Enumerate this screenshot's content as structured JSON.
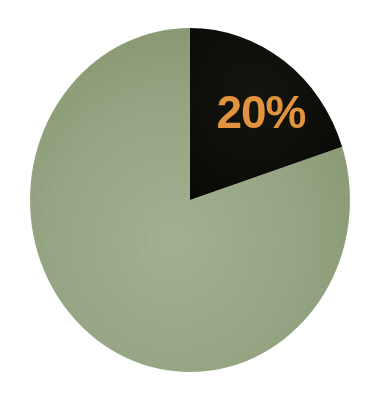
{
  "chart_data": {
    "type": "pie",
    "title": "",
    "subtitle": "",
    "xlabel": "",
    "ylabel": "",
    "grid": false,
    "legend_position": "none",
    "start_angle_deg": 0,
    "direction": "clockwise",
    "categories": [
      "Highlighted share",
      "Remainder"
    ],
    "values": [
      20,
      80
    ],
    "labels": [
      "20%",
      ""
    ],
    "colors": [
      "#0d0d0a",
      "#93a681"
    ],
    "annotations": [
      {
        "text": "20%",
        "slice": "Highlighted share",
        "value": 20,
        "color": "#e8973c"
      }
    ],
    "slices": [
      {
        "name": "Highlighted share",
        "value": 20,
        "percent": "20%",
        "color": "#0d0d0a",
        "label": "20%",
        "label_color": "#e8973c",
        "label_visible": true
      },
      {
        "name": "Remainder",
        "value": 80,
        "percent": "80%",
        "color": "#93a681",
        "label": "",
        "label_color": "",
        "label_visible": false
      }
    ]
  },
  "geometry": {
    "center_x": 190,
    "center_y": 200,
    "radius_x": 160,
    "radius_y": 172,
    "label_x": 261,
    "label_y": 128
  },
  "palette": {
    "background": "#ffffff",
    "slice_dark": "#0d0d0a",
    "slice_green": "#93a681",
    "slice_green_light": "#a3b391",
    "slice_green_dark": "#87996f",
    "accent_orange": "#e8973c"
  }
}
